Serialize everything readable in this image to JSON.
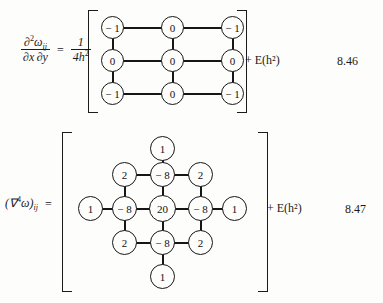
{
  "page": {
    "background": "#fdfdfb",
    "ink": "#1b1b1b"
  },
  "equations": [
    {
      "id": "8.46",
      "number": "8.46",
      "lhs_numerator": "∂²ω",
      "lhs_numerator_sub": "ij",
      "lhs_denominator": "∂x ∂y",
      "equals": "=",
      "coefficient_numerator": "1",
      "coefficient_denominator_base": "4h",
      "coefficient_denominator_exp": "2",
      "tail": "+ E(h²)",
      "stencil": {
        "type": "grid",
        "rows": 3,
        "cols": 3,
        "values": [
          [
            "− 1",
            "0",
            "− 1"
          ],
          [
            "0",
            "0",
            "0"
          ],
          [
            "− 1",
            "0",
            "− 1"
          ]
        ]
      }
    },
    {
      "id": "8.47",
      "number": "8.47",
      "lhs": "(∇⁴ω)",
      "lhs_sub": "ij",
      "equals": "=",
      "tail": "+ E(h²)",
      "stencil": {
        "type": "biharmonic-13-point",
        "center": "20",
        "edge_neighbors": "− 8",
        "diagonal_neighbors": "2",
        "outer_neighbors": "1",
        "nodes": [
          {
            "name": "top-outer",
            "value": "1",
            "col": 2,
            "row": 0
          },
          {
            "name": "upper-left",
            "value": "2",
            "col": 1,
            "row": 1
          },
          {
            "name": "upper-center",
            "value": "− 8",
            "col": 2,
            "row": 1
          },
          {
            "name": "upper-right",
            "value": "2",
            "col": 3,
            "row": 1
          },
          {
            "name": "left-outer",
            "value": "1",
            "col": 0,
            "row": 2
          },
          {
            "name": "middle-left",
            "value": "− 8",
            "col": 1,
            "row": 2
          },
          {
            "name": "center",
            "value": "20",
            "col": 2,
            "row": 2
          },
          {
            "name": "middle-right",
            "value": "− 8",
            "col": 3,
            "row": 2
          },
          {
            "name": "right-outer",
            "value": "1",
            "col": 4,
            "row": 2
          },
          {
            "name": "lower-left",
            "value": "2",
            "col": 1,
            "row": 3
          },
          {
            "name": "lower-center",
            "value": "− 8",
            "col": 2,
            "row": 3
          },
          {
            "name": "lower-right",
            "value": "2",
            "col": 3,
            "row": 3
          },
          {
            "name": "bottom-outer",
            "value": "1",
            "col": 2,
            "row": 4
          }
        ]
      }
    }
  ]
}
